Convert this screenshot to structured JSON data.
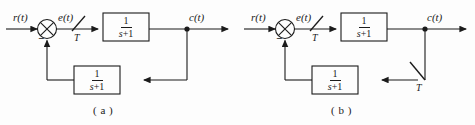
{
  "figure": {
    "type": "control-system-block-diagram",
    "stroke_color": "#1b1b1b",
    "background_color": "#fdfdfd",
    "diagrams": [
      {
        "id": "a",
        "caption": "( a )",
        "input_label": "r(t)",
        "error_label": "e(t)",
        "output_label": "c(t)",
        "summing_junction": {
          "type": "cross-circle",
          "negative_sign": "−"
        },
        "sampler": {
          "label": "T",
          "location": "forward-path-after-summer"
        },
        "forward_block": {
          "numerator": "1",
          "denominator_var": "s",
          "denominator_op": "+",
          "denominator_const": "1"
        },
        "feedback_block": {
          "numerator": "1",
          "denominator_var": "s",
          "denominator_op": "+",
          "denominator_const": "1"
        }
      },
      {
        "id": "b",
        "caption": "( b )",
        "input_label": "r(t)",
        "error_label": "e(t)",
        "output_label": "c(t)",
        "summing_junction": {
          "type": "cross-circle",
          "negative_sign": "−"
        },
        "sampler": {
          "label": "T",
          "location": "feedback-path-after-output-node"
        },
        "sampler_forward": {
          "label": "T",
          "location": "forward-path-after-summer"
        },
        "forward_block": {
          "numerator": "1",
          "denominator_var": "s",
          "denominator_op": "+",
          "denominator_const": "1"
        },
        "feedback_block": {
          "numerator": "1",
          "denominator_var": "s",
          "denominator_op": "+",
          "denominator_const": "1"
        }
      }
    ]
  }
}
